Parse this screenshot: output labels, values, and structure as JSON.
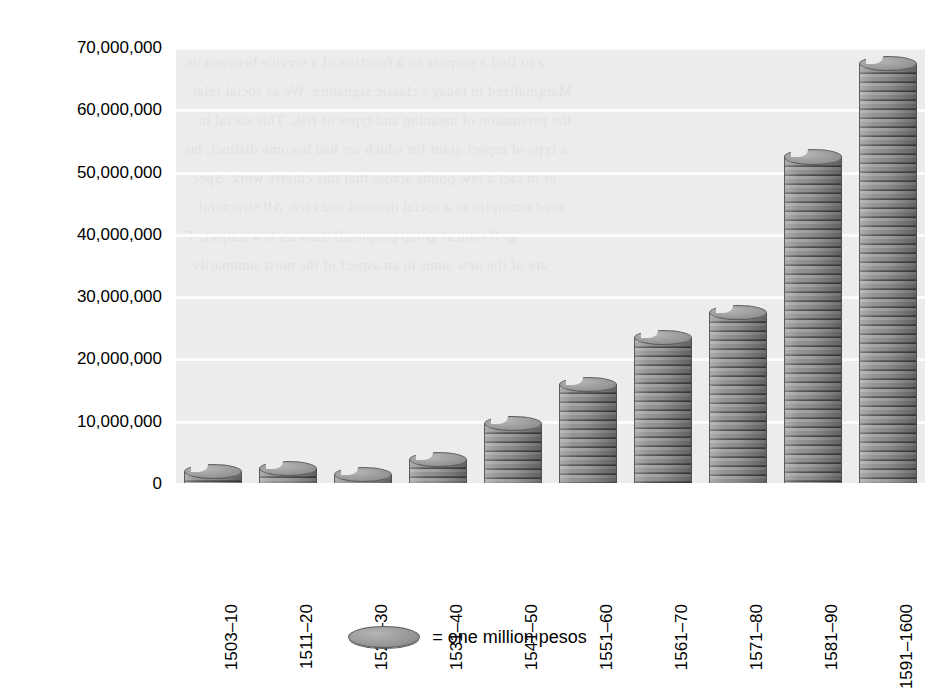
{
  "chart_data": {
    "type": "bar",
    "title": "",
    "subtitle": "",
    "xlabel": "",
    "ylabel": "",
    "categories": [
      "1503–10",
      "1511–20",
      "1521–30",
      "1531–40",
      "1541–50",
      "1551–60",
      "1561–70",
      "1571–80",
      "1581–90",
      "1591–1600"
    ],
    "values": [
      2000000,
      2500000,
      1500000,
      4000000,
      9700000,
      16000000,
      23500000,
      27500000,
      52500000,
      67500000
    ],
    "ylim": [
      0,
      70000000
    ],
    "ytick_values": [
      0,
      10000000,
      20000000,
      30000000,
      40000000,
      50000000,
      60000000,
      70000000
    ],
    "ytick_labels": [
      "0",
      "10,000,000",
      "20,000,000",
      "30,000,000",
      "40,000,000",
      "50,000,000",
      "60,000,000",
      "70,000,000"
    ],
    "grid": true,
    "grid_axis": "y",
    "legend_position": "bottom-center",
    "legend": [
      {
        "marker": "coin-disc",
        "label": "= one million pesos"
      }
    ],
    "bar_style": "stacked-coins",
    "unit": "pesos"
  },
  "legend": {
    "marker_name": "coin-disc-icon",
    "text": "= one million pesos"
  },
  "background_text": [
    "a to find a purpose or a function of a service between us",
    "Marginalized in today's classic signature. We as social relat",
    "the persuasion of meaning and types of risk. This social in",
    "a type of aspect grant for which we had become distinct, hu",
    "or in fact a few points across that this chiefly work. Spec",
    "nted examples to a social demand and race. All structural",
    "g. If ethical group people all theories is a subject. T",
    "are of the new sums to an aspect of the most summarily"
  ]
}
